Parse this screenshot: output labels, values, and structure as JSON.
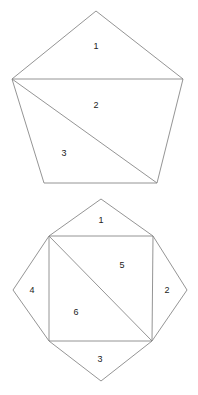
{
  "page": {
    "background_color": "#ffffff",
    "width": 198,
    "height": 395
  },
  "style": {
    "stroke_color": "#888888",
    "stroke_width": 0.9,
    "label_color": "#222222",
    "label_font_size": 9
  },
  "figures": [
    {
      "id": "figure-top",
      "name": "pentagon-with-two-internal-lines",
      "outline_label": "pentagon",
      "vertices": {
        "apex": [
          96,
          11
        ],
        "left": [
          12,
          79
        ],
        "right": [
          183,
          79
        ],
        "bottom_left": [
          44,
          183
        ],
        "bottom_right": [
          157,
          183
        ]
      },
      "outline_path": "M 96 11 L 183 79 L 157 183 L 44 183 L 12 79 Z",
      "internal_lines": [
        {
          "name": "horizontal-chord",
          "path": "M 12 79 L 183 79"
        },
        {
          "name": "diagonal-chord",
          "path": "M 12 79 L 157 183"
        }
      ],
      "regions": [
        {
          "label": "1",
          "name": "region-1",
          "x": 96,
          "y": 47
        },
        {
          "label": "2",
          "name": "region-2",
          "x": 96,
          "y": 106
        },
        {
          "label": "3",
          "name": "region-3",
          "x": 64,
          "y": 154
        }
      ]
    },
    {
      "id": "figure-bottom",
      "name": "octagon-with-inscribed-square-and-diagonal",
      "outline_label": "octagon",
      "vertices": {
        "top": [
          101,
          199
        ],
        "right": [
          187,
          290
        ],
        "bottom": [
          101,
          381
        ],
        "left": [
          13,
          290
        ],
        "square_top_left": [
          49,
          236
        ],
        "square_top_right": [
          153,
          236
        ],
        "square_bottom_right": [
          152,
          341
        ],
        "square_bottom_left": [
          49,
          341
        ]
      },
      "outline_path": "M 101 199 L 153 236 L 187 290 L 152 341 L 101 381 L 49 341 L 13 290 L 49 236 Z",
      "internal_lines": [
        {
          "name": "square-top-edge",
          "path": "M 49 236 L 153 236"
        },
        {
          "name": "square-right-edge",
          "path": "M 153 236 L 152 341"
        },
        {
          "name": "square-bottom-edge",
          "path": "M 152 341 L 49 341"
        },
        {
          "name": "square-left-edge",
          "path": "M 49 341 L 49 236"
        },
        {
          "name": "square-diagonal",
          "path": "M 49 236 L 152 341"
        }
      ],
      "regions": [
        {
          "label": "1",
          "name": "region-1",
          "x": 101,
          "y": 221
        },
        {
          "label": "2",
          "name": "region-2",
          "x": 167,
          "y": 291
        },
        {
          "label": "3",
          "name": "region-3",
          "x": 100,
          "y": 360
        },
        {
          "label": "4",
          "name": "region-4",
          "x": 32,
          "y": 291
        },
        {
          "label": "5",
          "name": "region-5",
          "x": 122,
          "y": 266
        },
        {
          "label": "6",
          "name": "region-6",
          "x": 76,
          "y": 313
        }
      ]
    }
  ]
}
